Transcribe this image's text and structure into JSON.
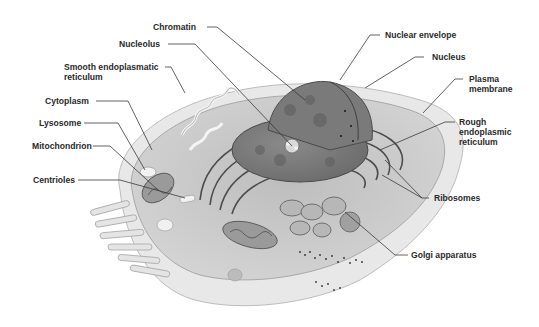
{
  "diagram": {
    "labels": {
      "chromatin": "Chromatin",
      "nucleolus": "Nucleolus",
      "smooth_er_line1": "Smooth endoplasmatic",
      "smooth_er_line2": "reticulum",
      "cytoplasm": "Cytoplasm",
      "lysosome": "Lysosome",
      "mitochondrion": "Mitochondrion",
      "centrioles": "Centrioles",
      "nuclear_envelope": "Nuclear envelope",
      "nucleus": "Nucleus",
      "plasma_membrane_line1": "Plasma",
      "plasma_membrane_line2": "membrane",
      "rough_er_line1": "Rough",
      "rough_er_line2": "endoplasmic",
      "rough_er_line3": "reticulum",
      "ribosomes": "Ribosomes",
      "golgi": "Golgi apparatus"
    },
    "colors": {
      "label_text": "#2a2a2a",
      "leader_line": "#3a3a3a",
      "cytoplasm_fill": "#c9c9c9",
      "membrane_fill": "#e6e6e6",
      "nucleus_fill": "#7d7d7d",
      "nucleus_dark": "#5e5e5e",
      "organelle_fill": "#a8a8a8"
    }
  }
}
